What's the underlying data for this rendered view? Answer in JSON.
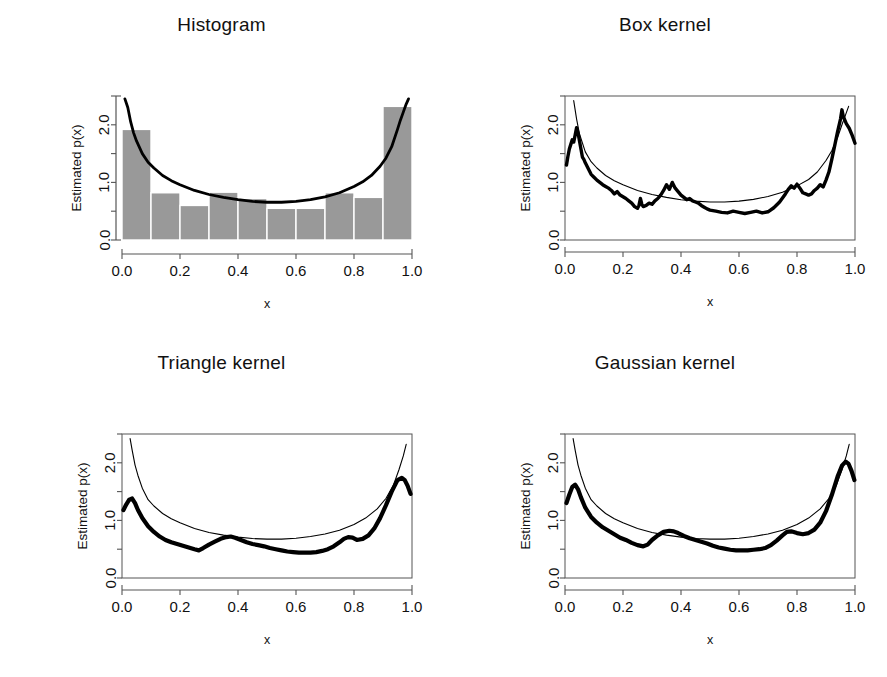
{
  "figure": {
    "panel_count": 4,
    "shared": {
      "xlabel": "x",
      "ylabel": "Estimated p(x)",
      "xticks": [
        "0.0",
        "0.2",
        "0.4",
        "0.6",
        "0.8",
        "1.0"
      ],
      "xtick_values": [
        0.0,
        0.2,
        0.4,
        0.6,
        0.8,
        1.0
      ],
      "yticks": [
        "0.0",
        "1.0",
        "2.0"
      ],
      "ytick_values": [
        0.0,
        1.0,
        2.0
      ],
      "yminor_values": [
        0.5,
        1.5,
        2.5
      ],
      "xlim": [
        0.0,
        1.0
      ],
      "ylim": [
        0.0,
        2.5
      ],
      "grid": false,
      "legend": null
    },
    "colors": {
      "bar_fill": "#999999",
      "bar_edge": "#ffffff",
      "true_curve": "#000000",
      "estimate_curve": "#000000",
      "axis": "#555555",
      "text": "#111111",
      "background": "#ffffff"
    }
  },
  "panels": [
    {
      "id": "histogram",
      "title": "Histogram"
    },
    {
      "id": "box-kernel",
      "title": "Box kernel"
    },
    {
      "id": "triangle-kernel",
      "title": "Triangle kernel"
    },
    {
      "id": "gaussian-kernel",
      "title": "Gaussian kernel"
    }
  ],
  "chart_data": [
    {
      "type": "bar",
      "id": "histogram",
      "title": "Histogram",
      "xlabel": "x",
      "ylabel": "Estimated p(x)",
      "xlim": [
        0.0,
        1.0
      ],
      "ylim": [
        0.0,
        2.5
      ],
      "grid": false,
      "bin_edges": [
        0.0,
        0.1,
        0.2,
        0.3,
        0.4,
        0.5,
        0.6,
        0.7,
        0.8,
        0.9,
        1.0
      ],
      "categories": [
        "0.0-0.1",
        "0.1-0.2",
        "0.2-0.3",
        "0.3-0.4",
        "0.4-0.5",
        "0.5-0.6",
        "0.6-0.7",
        "0.7-0.8",
        "0.8-0.9",
        "0.9-1.0"
      ],
      "values": [
        1.92,
        0.82,
        0.6,
        0.83,
        0.72,
        0.55,
        0.55,
        0.82,
        0.74,
        2.32
      ],
      "series": [
        {
          "name": "true density",
          "type": "line",
          "x": [
            0.01,
            0.02,
            0.03,
            0.04,
            0.05,
            0.07,
            0.09,
            0.11,
            0.14,
            0.17,
            0.2,
            0.25,
            0.3,
            0.35,
            0.4,
            0.45,
            0.5,
            0.55,
            0.6,
            0.65,
            0.7,
            0.75,
            0.8,
            0.83,
            0.86,
            0.89,
            0.91,
            0.93,
            0.95,
            0.96,
            0.97,
            0.98,
            0.988
          ],
          "y": [
            2.45,
            2.3,
            2.05,
            1.86,
            1.72,
            1.5,
            1.35,
            1.25,
            1.12,
            1.03,
            0.96,
            0.86,
            0.79,
            0.74,
            0.7,
            0.67,
            0.655,
            0.655,
            0.67,
            0.7,
            0.75,
            0.82,
            0.93,
            1.01,
            1.12,
            1.28,
            1.42,
            1.62,
            1.92,
            2.08,
            2.22,
            2.36,
            2.45
          ]
        }
      ]
    },
    {
      "type": "line",
      "id": "box-kernel",
      "title": "Box kernel",
      "xlabel": "x",
      "ylabel": "Estimated p(x)",
      "xlim": [
        0.0,
        1.0
      ],
      "ylim": [
        0.0,
        2.5
      ],
      "grid": false,
      "box_frame": true,
      "series": [
        {
          "name": "true density",
          "type": "line",
          "style": "thin",
          "x": [
            0.03,
            0.04,
            0.05,
            0.07,
            0.09,
            0.11,
            0.14,
            0.17,
            0.2,
            0.25,
            0.3,
            0.35,
            0.4,
            0.45,
            0.5,
            0.55,
            0.6,
            0.65,
            0.7,
            0.75,
            0.8,
            0.84,
            0.87,
            0.9,
            0.92,
            0.94,
            0.955,
            0.968,
            0.978
          ],
          "y": [
            2.42,
            2.1,
            1.84,
            1.53,
            1.36,
            1.25,
            1.12,
            1.03,
            0.96,
            0.86,
            0.79,
            0.74,
            0.7,
            0.675,
            0.66,
            0.66,
            0.675,
            0.705,
            0.755,
            0.83,
            0.94,
            1.05,
            1.18,
            1.38,
            1.55,
            1.78,
            2.0,
            2.18,
            2.32
          ]
        },
        {
          "name": "box kernel estimate",
          "type": "line",
          "style": "thick-noisy",
          "x": [
            0.005,
            0.01,
            0.015,
            0.02,
            0.025,
            0.03,
            0.035,
            0.04,
            0.045,
            0.05,
            0.055,
            0.06,
            0.065,
            0.07,
            0.08,
            0.09,
            0.1,
            0.11,
            0.12,
            0.13,
            0.14,
            0.15,
            0.16,
            0.17,
            0.18,
            0.19,
            0.2,
            0.21,
            0.22,
            0.23,
            0.24,
            0.25,
            0.255,
            0.26,
            0.265,
            0.27,
            0.28,
            0.29,
            0.3,
            0.31,
            0.32,
            0.33,
            0.34,
            0.35,
            0.36,
            0.37,
            0.38,
            0.39,
            0.4,
            0.41,
            0.42,
            0.43,
            0.44,
            0.45,
            0.46,
            0.47,
            0.48,
            0.49,
            0.5,
            0.52,
            0.54,
            0.56,
            0.58,
            0.6,
            0.62,
            0.64,
            0.66,
            0.68,
            0.7,
            0.72,
            0.74,
            0.76,
            0.77,
            0.78,
            0.79,
            0.8,
            0.81,
            0.82,
            0.83,
            0.84,
            0.85,
            0.86,
            0.87,
            0.88,
            0.89,
            0.9,
            0.91,
            0.92,
            0.93,
            0.94,
            0.95,
            0.955,
            0.96,
            0.97,
            0.98,
            0.99,
            1.0
          ],
          "y": [
            1.3,
            1.45,
            1.58,
            1.66,
            1.74,
            1.7,
            1.82,
            1.95,
            1.86,
            1.72,
            1.58,
            1.44,
            1.4,
            1.34,
            1.24,
            1.14,
            1.09,
            1.04,
            1.0,
            0.96,
            0.93,
            0.9,
            0.86,
            0.8,
            0.84,
            0.78,
            0.75,
            0.72,
            0.68,
            0.64,
            0.58,
            0.55,
            0.6,
            0.72,
            0.62,
            0.58,
            0.6,
            0.64,
            0.62,
            0.68,
            0.72,
            0.78,
            0.86,
            0.96,
            0.88,
            1.0,
            0.9,
            0.84,
            0.78,
            0.74,
            0.7,
            0.72,
            0.68,
            0.66,
            0.64,
            0.6,
            0.57,
            0.54,
            0.52,
            0.5,
            0.48,
            0.47,
            0.5,
            0.48,
            0.46,
            0.48,
            0.5,
            0.47,
            0.49,
            0.56,
            0.66,
            0.8,
            0.88,
            0.94,
            0.9,
            0.97,
            0.9,
            0.82,
            0.8,
            0.78,
            0.8,
            0.86,
            0.9,
            0.96,
            0.92,
            1.04,
            1.18,
            1.4,
            1.64,
            1.88,
            2.1,
            2.26,
            2.14,
            2.02,
            1.94,
            1.82,
            1.68
          ]
        }
      ]
    },
    {
      "type": "line",
      "id": "triangle-kernel",
      "title": "Triangle kernel",
      "xlabel": "x",
      "ylabel": "Estimated p(x)",
      "xlim": [
        0.0,
        1.0
      ],
      "ylim": [
        0.0,
        2.5
      ],
      "grid": false,
      "box_frame": true,
      "series": [
        {
          "name": "true density",
          "type": "line",
          "style": "thin",
          "x": [
            0.028,
            0.035,
            0.045,
            0.055,
            0.07,
            0.09,
            0.11,
            0.14,
            0.17,
            0.2,
            0.25,
            0.3,
            0.35,
            0.4,
            0.45,
            0.5,
            0.55,
            0.6,
            0.65,
            0.7,
            0.75,
            0.8,
            0.84,
            0.88,
            0.91,
            0.935,
            0.955,
            0.97,
            0.98
          ],
          "y": [
            2.42,
            2.22,
            1.96,
            1.78,
            1.56,
            1.36,
            1.25,
            1.12,
            1.03,
            0.96,
            0.86,
            0.79,
            0.745,
            0.71,
            0.685,
            0.675,
            0.675,
            0.69,
            0.72,
            0.765,
            0.83,
            0.93,
            1.04,
            1.2,
            1.38,
            1.6,
            1.88,
            2.12,
            2.32
          ]
        },
        {
          "name": "triangle kernel estimate",
          "type": "line",
          "style": "thick",
          "x": [
            0.005,
            0.015,
            0.025,
            0.035,
            0.045,
            0.055,
            0.07,
            0.09,
            0.11,
            0.13,
            0.15,
            0.17,
            0.19,
            0.21,
            0.23,
            0.25,
            0.265,
            0.28,
            0.3,
            0.32,
            0.34,
            0.36,
            0.375,
            0.39,
            0.41,
            0.43,
            0.45,
            0.47,
            0.49,
            0.51,
            0.53,
            0.55,
            0.57,
            0.59,
            0.61,
            0.63,
            0.65,
            0.67,
            0.69,
            0.71,
            0.73,
            0.75,
            0.765,
            0.78,
            0.795,
            0.81,
            0.83,
            0.85,
            0.87,
            0.89,
            0.91,
            0.93,
            0.95,
            0.965,
            0.975,
            0.985,
            0.995
          ],
          "y": [
            1.18,
            1.28,
            1.36,
            1.38,
            1.3,
            1.18,
            1.04,
            0.9,
            0.8,
            0.72,
            0.66,
            0.62,
            0.59,
            0.56,
            0.53,
            0.5,
            0.48,
            0.52,
            0.58,
            0.63,
            0.68,
            0.71,
            0.72,
            0.7,
            0.66,
            0.62,
            0.59,
            0.57,
            0.55,
            0.52,
            0.5,
            0.48,
            0.46,
            0.45,
            0.44,
            0.44,
            0.44,
            0.45,
            0.47,
            0.5,
            0.55,
            0.62,
            0.68,
            0.71,
            0.7,
            0.66,
            0.68,
            0.74,
            0.86,
            1.04,
            1.26,
            1.5,
            1.7,
            1.74,
            1.7,
            1.6,
            1.46
          ]
        }
      ]
    },
    {
      "type": "line",
      "id": "gaussian-kernel",
      "title": "Gaussian kernel",
      "xlabel": "x",
      "ylabel": "Estimated p(x)",
      "xlim": [
        0.0,
        1.0
      ],
      "ylim": [
        0.0,
        2.5
      ],
      "grid": false,
      "box_frame": true,
      "series": [
        {
          "name": "true density",
          "type": "line",
          "style": "thin",
          "x": [
            0.028,
            0.035,
            0.045,
            0.055,
            0.07,
            0.09,
            0.11,
            0.14,
            0.17,
            0.2,
            0.25,
            0.3,
            0.35,
            0.4,
            0.45,
            0.5,
            0.55,
            0.6,
            0.65,
            0.7,
            0.75,
            0.8,
            0.84,
            0.88,
            0.91,
            0.935,
            0.955,
            0.97,
            0.98
          ],
          "y": [
            2.42,
            2.22,
            1.96,
            1.78,
            1.56,
            1.36,
            1.25,
            1.12,
            1.03,
            0.96,
            0.86,
            0.79,
            0.745,
            0.71,
            0.685,
            0.675,
            0.675,
            0.69,
            0.72,
            0.765,
            0.83,
            0.93,
            1.04,
            1.2,
            1.38,
            1.6,
            1.88,
            2.12,
            2.32
          ]
        },
        {
          "name": "gaussian kernel estimate",
          "type": "line",
          "style": "thick",
          "x": [
            0.005,
            0.015,
            0.025,
            0.035,
            0.045,
            0.055,
            0.07,
            0.09,
            0.11,
            0.13,
            0.15,
            0.17,
            0.19,
            0.21,
            0.23,
            0.25,
            0.27,
            0.285,
            0.3,
            0.32,
            0.34,
            0.36,
            0.375,
            0.39,
            0.41,
            0.43,
            0.45,
            0.47,
            0.49,
            0.51,
            0.53,
            0.55,
            0.57,
            0.59,
            0.61,
            0.63,
            0.65,
            0.67,
            0.69,
            0.71,
            0.73,
            0.75,
            0.765,
            0.78,
            0.8,
            0.82,
            0.84,
            0.86,
            0.88,
            0.9,
            0.92,
            0.94,
            0.955,
            0.968,
            0.978,
            0.988,
            0.998
          ],
          "y": [
            1.3,
            1.45,
            1.58,
            1.62,
            1.54,
            1.4,
            1.22,
            1.06,
            0.96,
            0.88,
            0.82,
            0.76,
            0.7,
            0.66,
            0.61,
            0.57,
            0.55,
            0.58,
            0.66,
            0.74,
            0.8,
            0.82,
            0.81,
            0.78,
            0.73,
            0.69,
            0.66,
            0.63,
            0.6,
            0.56,
            0.53,
            0.51,
            0.49,
            0.48,
            0.48,
            0.48,
            0.49,
            0.5,
            0.52,
            0.57,
            0.65,
            0.74,
            0.8,
            0.81,
            0.78,
            0.76,
            0.78,
            0.84,
            0.96,
            1.16,
            1.44,
            1.76,
            1.95,
            2.02,
            1.98,
            1.86,
            1.7
          ]
        }
      ]
    }
  ]
}
